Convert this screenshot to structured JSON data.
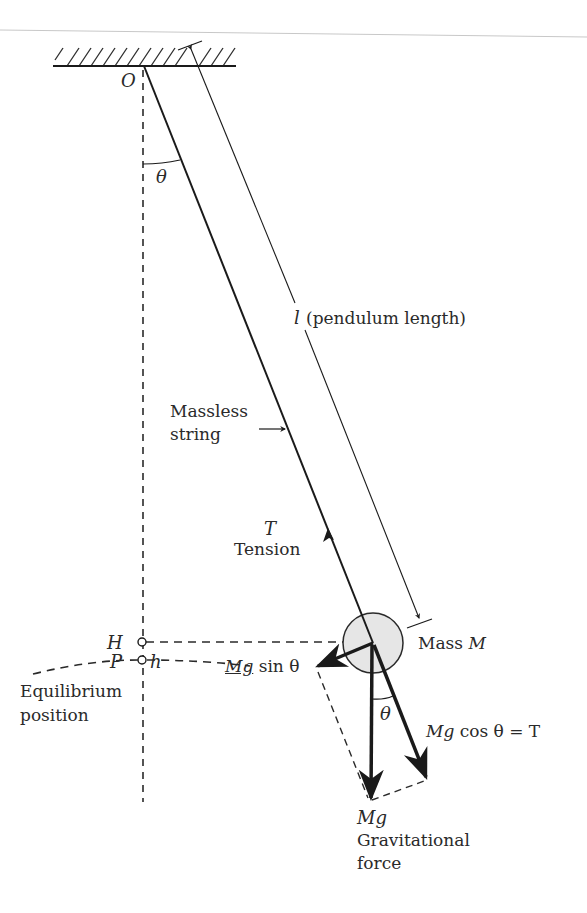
{
  "diagram": {
    "colors": {
      "line": "#1a1a1a",
      "mass_fill": "#e6e6e6",
      "dashed": "#2a2a2a",
      "page_rule": "#c8c8c8"
    },
    "labels": {
      "pivot": "O",
      "angle_top": "θ",
      "length_symbol": "l",
      "length_text": "(pendulum length)",
      "string_line1": "Massless",
      "string_line2": "string",
      "tension_symbol": "T",
      "tension_text": "Tension",
      "mass_text": "Mass",
      "mass_symbol": "M",
      "point_h": "H",
      "height_symbol": "h",
      "point_p": "P",
      "equilibrium_line1": "Equilibrium",
      "equilibrium_line2": "position",
      "tangential_force": "Mg",
      "tangential_trig": "sin θ",
      "angle_bottom": "θ",
      "radial_force_sym": "Mg",
      "radial_force_rest": "cos θ = T",
      "gravity_symbol": "Mg",
      "gravity_line1": "Gravitational",
      "gravity_line2": "force"
    },
    "geometry": {
      "pivot": [
        144,
        66
      ],
      "mass_center": [
        373,
        643
      ],
      "mass_radius": 30,
      "point_h": [
        142,
        642
      ],
      "point_p": [
        142,
        660
      ],
      "gravity_tip": [
        370,
        800
      ],
      "tangential_tip": [
        316,
        667
      ],
      "radial_tip": [
        427,
        779
      ]
    }
  }
}
